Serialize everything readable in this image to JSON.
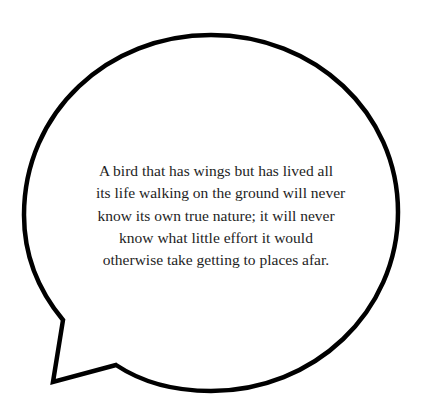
{
  "speech_bubble": {
    "stroke_color": "#000000",
    "fill_color": "#ffffff",
    "quote_lines": [
      "A bird that has wings but has lived all",
      "its life walking on the ground will never",
      "know its own true nature; it will never",
      "know what little effort it would",
      "otherwise take getting to places afar."
    ]
  }
}
